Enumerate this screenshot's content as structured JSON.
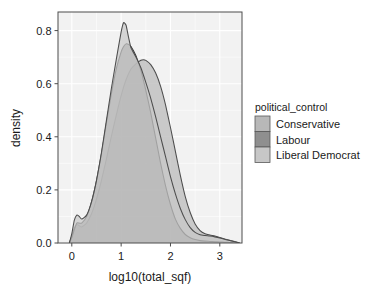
{
  "chart_data": {
    "type": "area",
    "title": "",
    "xlabel": "log10(total_sqf)",
    "ylabel": "density",
    "xlim": [
      -0.28,
      3.45
    ],
    "ylim": [
      0.0,
      0.87
    ],
    "xticks": [
      "0",
      "1",
      "2",
      "3"
    ],
    "xtick_values": [
      0,
      1,
      2,
      3
    ],
    "yticks": [
      "0.0",
      "0.2",
      "0.4",
      "0.6",
      "0.8"
    ],
    "ytick_values": [
      0.0,
      0.2,
      0.4,
      0.6,
      0.8
    ],
    "grid": true,
    "legend_position": "right",
    "legend_title": "political_control",
    "series": [
      {
        "name": "Conservative",
        "color": "#b8b8b8",
        "line_color": "#4d4d4d",
        "peak_x": 1.45,
        "peak_y": 0.69,
        "x": [
          -0.05,
          0.0,
          0.05,
          0.1,
          0.15,
          0.2,
          0.3,
          0.4,
          0.5,
          0.6,
          0.7,
          0.8,
          0.9,
          1.0,
          1.1,
          1.2,
          1.3,
          1.4,
          1.45,
          1.5,
          1.6,
          1.7,
          1.8,
          1.9,
          2.0,
          2.1,
          2.2,
          2.3,
          2.4,
          2.5,
          2.6,
          2.7,
          2.8,
          2.9,
          3.0,
          3.1,
          3.2,
          3.3,
          3.4
        ],
        "y": [
          0.0,
          0.025,
          0.055,
          0.07,
          0.065,
          0.06,
          0.075,
          0.11,
          0.165,
          0.235,
          0.315,
          0.4,
          0.48,
          0.555,
          0.615,
          0.655,
          0.675,
          0.688,
          0.69,
          0.688,
          0.672,
          0.64,
          0.59,
          0.52,
          0.435,
          0.345,
          0.255,
          0.175,
          0.115,
          0.072,
          0.047,
          0.035,
          0.03,
          0.026,
          0.021,
          0.015,
          0.01,
          0.006,
          0.0
        ]
      },
      {
        "name": "Labour",
        "color": "#8f8f8f",
        "line_color": "#3a3a3a",
        "peak_x": 1.1,
        "peak_y": 0.75,
        "x": [
          -0.05,
          0.0,
          0.05,
          0.1,
          0.15,
          0.2,
          0.3,
          0.4,
          0.5,
          0.6,
          0.7,
          0.8,
          0.9,
          1.0,
          1.05,
          1.1,
          1.15,
          1.2,
          1.3,
          1.4,
          1.5,
          1.6,
          1.7,
          1.8,
          1.9,
          2.0,
          2.1,
          2.2,
          2.3,
          2.4,
          2.5,
          2.6,
          2.7,
          2.8,
          2.9,
          3.0,
          3.1,
          3.2,
          3.3,
          3.4
        ],
        "y": [
          0.0,
          0.02,
          0.05,
          0.075,
          0.075,
          0.075,
          0.1,
          0.155,
          0.235,
          0.335,
          0.45,
          0.56,
          0.655,
          0.72,
          0.74,
          0.75,
          0.748,
          0.74,
          0.705,
          0.65,
          0.575,
          0.49,
          0.395,
          0.3,
          0.215,
          0.145,
          0.09,
          0.055,
          0.032,
          0.02,
          0.013,
          0.009,
          0.007,
          0.006,
          0.005,
          0.004,
          0.003,
          0.002,
          0.001,
          0.0
        ]
      },
      {
        "name": "Liberal Democrat",
        "color": "#c7c7c7",
        "line_color": "#4d4d4d",
        "peak_x": 1.05,
        "peak_y": 0.83,
        "x": [
          -0.05,
          0.0,
          0.05,
          0.1,
          0.15,
          0.2,
          0.3,
          0.4,
          0.5,
          0.6,
          0.7,
          0.8,
          0.9,
          1.0,
          1.05,
          1.1,
          1.15,
          1.2,
          1.3,
          1.4,
          1.5,
          1.6,
          1.7,
          1.8,
          1.9,
          2.0,
          2.1,
          2.2,
          2.3,
          2.4,
          2.5,
          2.6,
          2.7,
          2.8,
          2.9,
          3.0,
          3.1,
          3.2,
          3.3,
          3.4
        ],
        "y": [
          0.0,
          0.035,
          0.085,
          0.105,
          0.1,
          0.09,
          0.105,
          0.155,
          0.235,
          0.34,
          0.46,
          0.58,
          0.69,
          0.795,
          0.83,
          0.82,
          0.775,
          0.735,
          0.7,
          0.66,
          0.605,
          0.545,
          0.475,
          0.4,
          0.325,
          0.25,
          0.185,
          0.13,
          0.088,
          0.058,
          0.04,
          0.031,
          0.028,
          0.026,
          0.023,
          0.019,
          0.014,
          0.009,
          0.005,
          0.0
        ]
      }
    ]
  },
  "panel": {
    "background": "#f2f2f2",
    "grid_color": "#ffffff",
    "border_color": "#4d4d4d"
  },
  "legend": {
    "title": "political_control",
    "items": [
      {
        "label": "Conservative",
        "swatch": "#b8b8b8"
      },
      {
        "label": "Labour",
        "swatch": "#8f8f8f"
      },
      {
        "label": "Liberal Democrat",
        "swatch": "#c7c7c7"
      }
    ]
  }
}
